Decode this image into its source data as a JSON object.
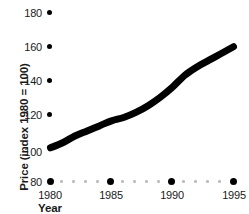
{
  "chart_data": {
    "type": "line",
    "title": "",
    "subtitle": "",
    "xlabel": "Year",
    "ylabel": "Price (index 1980 = 100)",
    "xlim": [
      1980,
      1995
    ],
    "ylim": [
      80,
      180
    ],
    "grid": false,
    "legend": null,
    "y_ticks": [
      180,
      160,
      140,
      120,
      100,
      80
    ],
    "y_tick_labels": [
      "180",
      "160",
      "140",
      "120",
      "100",
      "80"
    ],
    "x_ticks": [
      1980,
      1985,
      1990,
      1995
    ],
    "x_tick_labels": [
      "1980",
      "1985",
      "1990",
      "1995"
    ],
    "x": [
      1980,
      1981,
      1982,
      1983,
      1984,
      1985,
      1986,
      1987,
      1988,
      1989,
      1990,
      1991,
      1992,
      1993,
      1994,
      1995
    ],
    "values": [
      100,
      103,
      107,
      110,
      113,
      116,
      118,
      121,
      125,
      130,
      136,
      143,
      148,
      152,
      156,
      160
    ],
    "series": [
      {
        "name": "Price index",
        "values": [
          100,
          103,
          107,
          110,
          113,
          116,
          118,
          121,
          125,
          130,
          136,
          143,
          148,
          152,
          156,
          160
        ],
        "color": "#000000",
        "line_width": 7
      }
    ],
    "annotations": []
  },
  "axis": {
    "y_label_0": "180",
    "y_label_1": "160",
    "y_label_2": "140",
    "y_label_3": "120",
    "y_label_4": "100",
    "y_label_5": "80",
    "x_label_0": "1980",
    "x_label_1": "1985",
    "x_label_2": "1990",
    "x_label_3": "1995",
    "x_title": "Year",
    "y_title": "Price (index 1980 = 100)"
  },
  "style": {
    "background": "#ffffff",
    "line_color": "#000000",
    "tick_dot_color": "#000000",
    "minor_dot_color": "#bdbdbd",
    "text_color": "#1a1a1a"
  }
}
